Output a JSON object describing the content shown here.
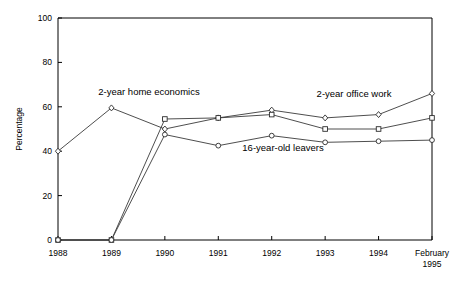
{
  "chart_data": {
    "type": "line",
    "title": "",
    "xlabel": "",
    "ylabel": "Percentage",
    "ylim": [
      0,
      100
    ],
    "yticks": [
      0,
      20,
      40,
      60,
      80,
      100
    ],
    "ytick_labels": [
      "0",
      "20",
      "40",
      "60",
      "80",
      "100"
    ],
    "grid": false,
    "legend_position": "inline-annotations",
    "categories": [
      "1988",
      "1989",
      "1990",
      "1991",
      "1992",
      "1993",
      "1994",
      "February 1995"
    ],
    "xtick_labels": [
      "1988",
      "1989",
      "1990",
      "1991",
      "1992",
      "1993",
      "1994",
      "February"
    ],
    "xtick_label_last_line2": "1995",
    "series": [
      {
        "name": "2-year home economics",
        "marker": "diamond-open",
        "values": [
          40,
          59.5,
          50,
          55,
          58.5,
          55,
          56.5,
          66
        ]
      },
      {
        "name": "2-year office work",
        "marker": "square-open",
        "values": [
          0,
          0,
          54.5,
          55,
          56.5,
          50,
          50,
          55
        ]
      },
      {
        "name": "16-year-old leavers",
        "marker": "circle-open",
        "values": [
          0,
          0,
          47.5,
          42.5,
          47,
          44,
          44.5,
          45
        ]
      }
    ],
    "annotations": [
      {
        "text": "2-year home economics",
        "x": 149,
        "y": 95
      },
      {
        "text": "2-year office work",
        "x": 354,
        "y": 97
      },
      {
        "text": "16-year-old leavers",
        "x": 283,
        "y": 151
      }
    ]
  }
}
